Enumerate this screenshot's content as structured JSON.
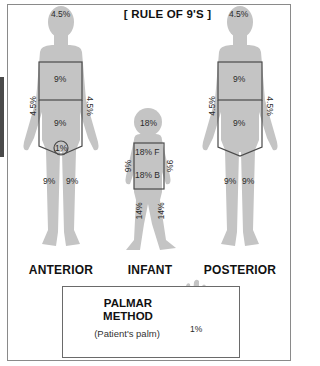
{
  "title": "[ RULE OF 9'S ]",
  "figures": {
    "anterior": {
      "caption": "ANTERIOR",
      "head": "4.5%",
      "chest": "9%",
      "abdomen": "9%",
      "left_arm": "4.5%",
      "right_arm": "4.5%",
      "genitals": "1%",
      "left_leg": "9%",
      "right_leg": "9%"
    },
    "infant": {
      "caption": "INFANT",
      "head": "18%",
      "trunk_front": "18% F",
      "trunk_back": "18% B",
      "left_arm": "9%",
      "right_arm": "9%",
      "left_leg": "14%",
      "right_leg": "14%"
    },
    "posterior": {
      "caption": "POSTERIOR",
      "head": "4.5%",
      "upper_back": "9%",
      "lower_back": "9%",
      "left_arm": "4.5%",
      "right_arm": "4.5%",
      "left_leg": "9%",
      "right_leg": "9%"
    }
  },
  "palmar": {
    "title_line1": "PALMAR",
    "title_line2": "METHOD",
    "subtitle": "(Patient's palm)",
    "hand_value": "1%"
  },
  "colors": {
    "silhouette": "#c4c4c4",
    "outline": "#4a4a4a",
    "frame": "#8a8a8a"
  }
}
